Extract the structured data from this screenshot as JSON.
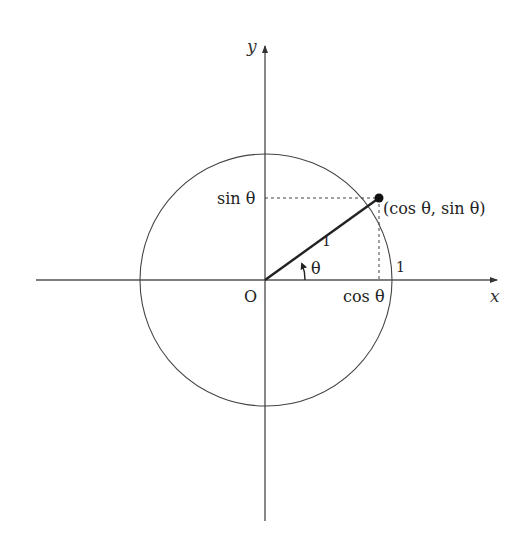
{
  "diagram": {
    "colors": {
      "stroke": "#333333",
      "axis": "#555555",
      "text": "#222222",
      "background": "#ffffff"
    },
    "axes": {
      "x_label": "x",
      "y_label": "y"
    },
    "labels": {
      "origin": "O",
      "point": "(cos θ, sin θ)",
      "sin": "sin θ",
      "cos": "cos θ",
      "radius": "1",
      "unit_on_axis": "1",
      "angle": "θ"
    }
  }
}
